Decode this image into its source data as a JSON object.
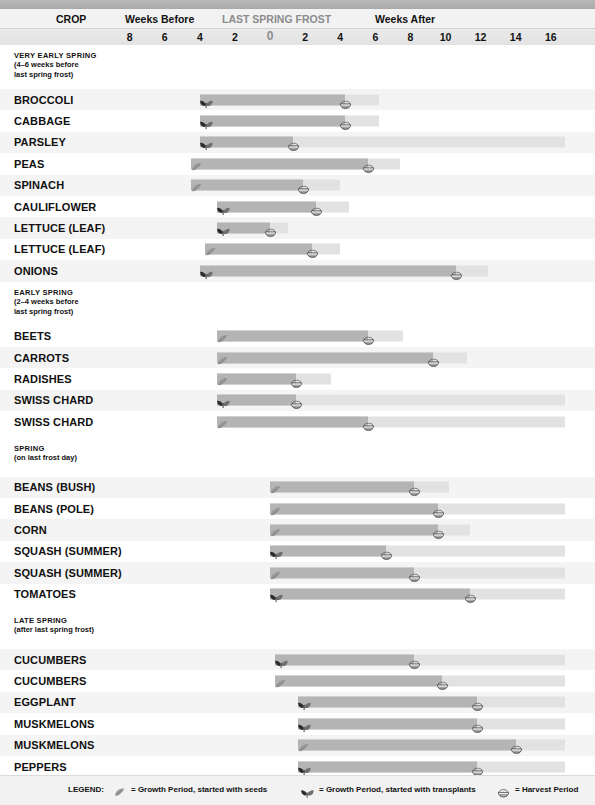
{
  "banner": {
    "ghost_text": ""
  },
  "header": {
    "crop_label": "CROP",
    "weeks_before_label": "Weeks Before",
    "frost_label": "LAST SPRING FROST",
    "weeks_after_label": "Weeks After"
  },
  "axis": {
    "ticks": [
      "8",
      "6",
      "4",
      "2",
      "0",
      "2",
      "4",
      "6",
      "8",
      "10",
      "12",
      "14",
      "16"
    ],
    "tick_weeks": [
      -8,
      -6,
      -4,
      -2,
      0,
      2,
      4,
      6,
      8,
      10,
      12,
      14,
      16
    ],
    "zero_tick_index": 4,
    "xmin_week": -9,
    "xmax_week": 17
  },
  "colors": {
    "growth_bar": "#b4b4b4",
    "harvest_bar": "#e2e2e2",
    "frost_line": "#3b3b3b",
    "row_alt": "#f4f4f4",
    "header_bg": "#f2f2f2",
    "text": "#111111",
    "frost_text": "#8c8c8c"
  },
  "legend": {
    "title": "LEGEND:",
    "items": [
      {
        "icon": "seed-icon",
        "label": "= Growth Period, started with seeds"
      },
      {
        "icon": "transplant-icon",
        "label": "= Growth Period, started with transplants"
      },
      {
        "icon": "harvest-basket-icon",
        "label": "= Harvest Period"
      }
    ]
  },
  "chart_data": {
    "type": "bar",
    "xlabel": "Weeks Before / Weeks After Last Spring Frost",
    "ylabel": "Crop",
    "xlim": [
      -9,
      17
    ],
    "grid": true,
    "sections": [
      {
        "id": "very-early-spring",
        "title": "VERY EARLY SPRING",
        "subtitle_lines": [
          "(4–6 weeks before",
          "last spring frost)"
        ],
        "rows": [
          {
            "crop": "BROCCOLI",
            "start_type": "transplant",
            "start_week": -4,
            "growth_end_week": 4.3,
            "harvest_end_week": 6.2
          },
          {
            "crop": "CABBAGE",
            "start_type": "transplant",
            "start_week": -4,
            "growth_end_week": 4.3,
            "harvest_end_week": 6.2
          },
          {
            "crop": "PARSLEY",
            "start_type": "transplant",
            "start_week": -4,
            "growth_end_week": 1.3,
            "harvest_end_week": 16.8
          },
          {
            "crop": "PEAS",
            "start_type": "seed",
            "start_week": -4.5,
            "growth_end_week": 5.6,
            "harvest_end_week": 7.4
          },
          {
            "crop": "SPINACH",
            "start_type": "seed",
            "start_week": -4.5,
            "growth_end_week": 1.9,
            "harvest_end_week": 4.0
          },
          {
            "crop": "CAULIFLOWER",
            "start_type": "transplant",
            "start_week": -3,
            "growth_end_week": 2.6,
            "harvest_end_week": 4.5
          },
          {
            "crop": "LETTUCE (LEAF)",
            "start_type": "transplant",
            "start_week": -3,
            "growth_end_week": 0.0,
            "harvest_end_week": 1.0
          },
          {
            "crop": "LETTUCE (LEAF)",
            "start_type": "seed",
            "start_week": -3.7,
            "growth_end_week": 2.4,
            "harvest_end_week": 4.0
          },
          {
            "crop": "ONIONS",
            "start_type": "transplant",
            "start_week": -4,
            "growth_end_week": 10.6,
            "harvest_end_week": 12.4
          }
        ]
      },
      {
        "id": "early-spring",
        "title": "EARLY SPRING",
        "subtitle_lines": [
          "(2–4 weeks before",
          "last spring frost)"
        ],
        "rows": [
          {
            "crop": "BEETS",
            "start_type": "seed",
            "start_week": -3,
            "growth_end_week": 5.6,
            "harvest_end_week": 7.6
          },
          {
            "crop": "CARROTS",
            "start_type": "seed",
            "start_week": -3,
            "growth_end_week": 9.3,
            "harvest_end_week": 11.2
          },
          {
            "crop": "RADISHES",
            "start_type": "seed",
            "start_week": -3,
            "growth_end_week": 1.5,
            "harvest_end_week": 3.5
          },
          {
            "crop": "SWISS CHARD",
            "start_type": "transplant",
            "start_week": -3,
            "growth_end_week": 1.5,
            "harvest_end_week": 16.8
          },
          {
            "crop": "SWISS CHARD",
            "start_type": "seed",
            "start_week": -3,
            "growth_end_week": 5.6,
            "harvest_end_week": 16.8
          }
        ]
      },
      {
        "id": "spring",
        "title": "SPRING",
        "subtitle_lines": [
          "(on last frost day)"
        ],
        "rows": [
          {
            "crop": "BEANS (BUSH)",
            "start_type": "seed",
            "start_week": 0,
            "growth_end_week": 8.2,
            "harvest_end_week": 10.2
          },
          {
            "crop": "BEANS (POLE)",
            "start_type": "seed",
            "start_week": 0,
            "growth_end_week": 9.6,
            "harvest_end_week": 16.8
          },
          {
            "crop": "CORN",
            "start_type": "seed",
            "start_week": 0,
            "growth_end_week": 9.6,
            "harvest_end_week": 11.4
          },
          {
            "crop": "SQUASH (SUMMER)",
            "start_type": "transplant",
            "start_week": 0,
            "growth_end_week": 6.6,
            "harvest_end_week": 16.8
          },
          {
            "crop": "SQUASH (SUMMER)",
            "start_type": "seed",
            "start_week": 0,
            "growth_end_week": 8.2,
            "harvest_end_week": 16.8
          },
          {
            "crop": "TOMATOES",
            "start_type": "transplant",
            "start_week": 0,
            "growth_end_week": 11.4,
            "harvest_end_week": 16.8
          }
        ]
      },
      {
        "id": "late-spring",
        "title": "LATE SPRING",
        "subtitle_lines": [
          "(after last spring frost)"
        ],
        "rows": [
          {
            "crop": "CUCUMBERS",
            "start_type": "transplant",
            "start_week": 0.3,
            "growth_end_week": 8.2,
            "harvest_end_week": 16.8
          },
          {
            "crop": "CUCUMBERS",
            "start_type": "seed",
            "start_week": 0.3,
            "growth_end_week": 9.8,
            "harvest_end_week": 16.8
          },
          {
            "crop": "EGGPLANT",
            "start_type": "transplant",
            "start_week": 1.6,
            "growth_end_week": 11.8,
            "harvest_end_week": 16.8
          },
          {
            "crop": "MUSKMELONS",
            "start_type": "transplant",
            "start_week": 1.6,
            "growth_end_week": 11.8,
            "harvest_end_week": 16.8
          },
          {
            "crop": "MUSKMELONS",
            "start_type": "seed",
            "start_week": 1.6,
            "growth_end_week": 14.0,
            "harvest_end_week": 16.8
          },
          {
            "crop": "PEPPERS",
            "start_type": "transplant",
            "start_week": 1.6,
            "growth_end_week": 11.8,
            "harvest_end_week": 16.8
          },
          {
            "crop": "SQUASH (WINTER)",
            "start_type": "seed",
            "start_week": 1.6,
            "growth_end_week": 14.4,
            "harvest_end_week": 16.8
          }
        ]
      }
    ]
  }
}
